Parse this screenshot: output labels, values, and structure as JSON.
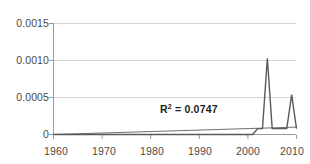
{
  "chart_data": {
    "type": "line",
    "title": "",
    "subtitle": "",
    "xlabel": "",
    "ylabel": "",
    "xlim": [
      1960,
      2010
    ],
    "ylim": [
      0,
      0.0015
    ],
    "grid": true,
    "legend": false,
    "x_ticks": [
      1960,
      1970,
      1980,
      1990,
      2000,
      2010
    ],
    "x_tick_labels": [
      "1960",
      "1970",
      "1980",
      "1990",
      "2000",
      "2010"
    ],
    "y_ticks": [
      0,
      0.0005,
      0.001,
      0.0015
    ],
    "y_tick_labels": [
      "0",
      "0.0005",
      "0.0010",
      "0.0015"
    ],
    "series": [
      {
        "name": "data",
        "color": "#595959",
        "x": [
          1960,
          1961,
          1962,
          1963,
          1964,
          1965,
          1966,
          1967,
          1968,
          1969,
          1970,
          1971,
          1972,
          1973,
          1974,
          1975,
          1976,
          1977,
          1978,
          1979,
          1980,
          1981,
          1982,
          1983,
          1984,
          1985,
          1986,
          1987,
          1988,
          1989,
          1990,
          1991,
          1992,
          1993,
          1994,
          1995,
          1996,
          1997,
          1998,
          1999,
          2000,
          2001,
          2002,
          2003,
          2004,
          2005,
          2006,
          2007,
          2008,
          2009,
          2010
        ],
        "values": [
          0,
          0,
          0,
          0,
          0,
          0,
          0,
          0,
          0,
          0,
          0,
          0,
          0,
          0,
          0,
          0,
          0,
          0,
          0,
          0,
          0,
          0,
          0,
          0,
          0,
          0,
          0,
          0,
          0,
          0,
          0,
          0,
          0,
          0,
          0,
          0,
          0,
          0,
          0,
          0,
          0,
          0,
          8e-05,
          8e-05,
          0.00103,
          8e-05,
          8e-05,
          8e-05,
          8e-05,
          0.00054,
          8e-05
        ]
      },
      {
        "name": "linear-trend",
        "color": "#6e6e6e",
        "x": [
          1960,
          2010
        ],
        "values": [
          0,
          0.0001
        ]
      }
    ],
    "annotations": [
      {
        "name": "r-squared",
        "text_prefix": "R",
        "text_superscript": "2",
        "text_suffix": " = 0.0747",
        "full_text": "R2 = 0.0747",
        "value": 0.0747,
        "x": 1992,
        "y": 0.00025
      }
    ],
    "colors": {
      "background": "#ffffff",
      "gridline": "#d4d4d4",
      "axis": "#9a9a9a",
      "series": "#595959",
      "trend": "#6e6e6e",
      "tick_text": "#4a4a4a",
      "annotation_text": "#1c1c1c"
    }
  }
}
